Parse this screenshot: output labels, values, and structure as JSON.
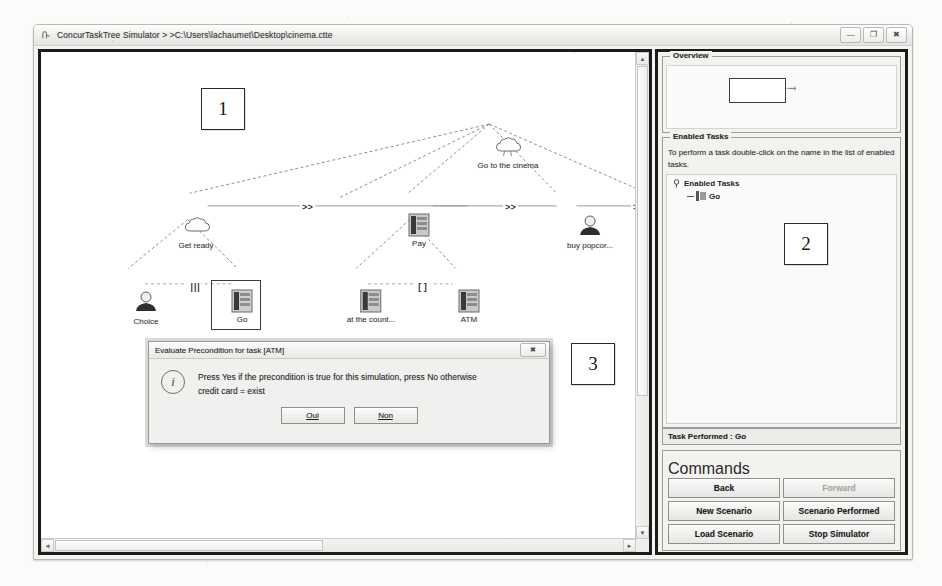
{
  "window": {
    "title": "ConcurTaskTree Simulator > >C:\\Users\\lachaumet\\Desktop\\cinema.ctte",
    "app_icon": "application-icon",
    "controls": {
      "minimize": "—",
      "maximize": "❐",
      "close": "✖"
    }
  },
  "annotations": [
    {
      "id": "1",
      "label": "1"
    },
    {
      "id": "2",
      "label": "2"
    },
    {
      "id": "3",
      "label": "3"
    }
  ],
  "tree": {
    "root": {
      "label": "Go to the cinema",
      "glyph": "abstract-task-icon"
    },
    "level2": [
      {
        "label": "Get ready",
        "glyph": "abstract-task-icon"
      },
      {
        "label": "Pay",
        "glyph": "application-task-icon"
      },
      {
        "label": "buy popcor...",
        "glyph": "user-task-icon"
      }
    ],
    "level3": [
      {
        "label": "Choice",
        "glyph": "user-task-icon"
      },
      {
        "label": "Go",
        "glyph": "application-task-icon",
        "selected": true
      },
      {
        "label": "at the count...",
        "glyph": "application-task-icon"
      },
      {
        "label": "ATM",
        "glyph": "application-task-icon"
      }
    ],
    "operators": {
      "enabling_1": ">>",
      "enabling_2": ">>",
      "enabling_3": ">>",
      "interleave": "|||",
      "choice": "[]"
    }
  },
  "right_panel": {
    "overview": {
      "title": "Overview"
    },
    "enabled_tasks": {
      "title": "Enabled Tasks",
      "help": "To perform a task double-click on the name in the list of enabled tasks.",
      "tree_root": "Enabled Tasks",
      "tree_items": [
        "Go"
      ]
    },
    "status": "Task Performed : Go",
    "commands": {
      "title": "Commands",
      "buttons": [
        {
          "label": "Back",
          "disabled": false
        },
        {
          "label": "Forward",
          "disabled": true
        },
        {
          "label": "New Scenario",
          "disabled": false
        },
        {
          "label": "Scenario Performed",
          "disabled": false
        },
        {
          "label": "Load Scenario",
          "disabled": false
        },
        {
          "label": "Stop Simulator",
          "disabled": false
        }
      ]
    }
  },
  "dialog": {
    "title": "Evaluate Precondition for task [ATM]",
    "close_glyph": "✖",
    "info_glyph": "i",
    "message_line1": "Press Yes if the precondition is true for this simulation, press No otherwise",
    "message_line2": "credit card = exist",
    "buttons": [
      {
        "label": "Oui",
        "mnemonic": "O"
      },
      {
        "label": "Non",
        "mnemonic": "N"
      }
    ]
  },
  "scrollbars": {
    "left_arrow": "◄",
    "right_arrow": "►",
    "up_arrow": "▲",
    "down_arrow": "▼"
  }
}
